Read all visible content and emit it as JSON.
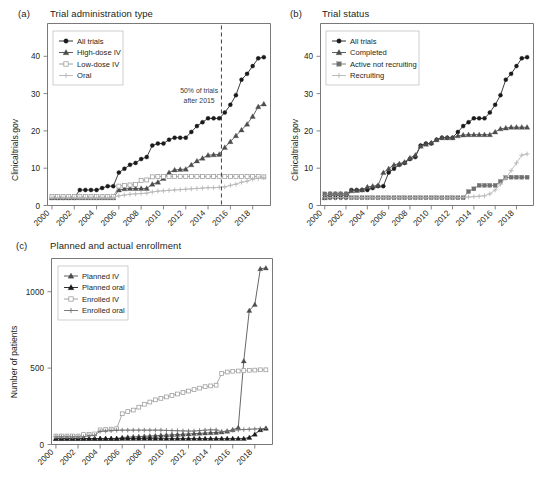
{
  "figure": {
    "background": "#ffffff",
    "width": 551,
    "height": 487
  },
  "panels": {
    "a": {
      "letter": "(a)",
      "title": "Trial administration type"
    },
    "b": {
      "letter": "(b)",
      "title": "Trial status"
    },
    "c": {
      "letter": "(c)",
      "title": "Planned and actual enrollment"
    }
  },
  "colors": {
    "all_trials": "#1a1a1a",
    "secondary": "#4d4d4d",
    "tertiary": "#9a9a9a",
    "quaternary": "#b5b5b5",
    "axis": "#6a6a6a",
    "text": "#231f20",
    "annotation": "#3a3a3a"
  },
  "chart_data": [
    {
      "id": "panel-a",
      "type": "line",
      "title": "Trial administration type",
      "panel_letter": "(a)",
      "xlabel": "",
      "ylabel": "Clinicaltrials.gov",
      "xlim": [
        1999.6,
        2019.6
      ],
      "ylim": [
        -2,
        45
      ],
      "yticks": [
        0,
        10,
        20,
        30,
        40
      ],
      "ytick_labels": [
        "0",
        "10",
        "20",
        "30",
        "40"
      ],
      "xticks": [
        2000,
        2002,
        2004,
        2006,
        2008,
        2010,
        2012,
        2014,
        2016,
        2018
      ],
      "xtick_labels": [
        "2000",
        "2002",
        "2004",
        "2006",
        "2008",
        "2010",
        "2012",
        "2014",
        "2016",
        "2018"
      ],
      "grid": false,
      "legend_position": "upper-left",
      "annotations": [
        {
          "text_line1": "50% of trials",
          "text_line2": "after 2015",
          "x": 2013.2,
          "y": 27
        }
      ],
      "vline": {
        "x": 2015.2,
        "style": "dashed",
        "label": "50% of trials after 2015"
      },
      "x": [
        2000,
        2000.5,
        2001,
        2001.5,
        2002,
        2002.5,
        2003,
        2003.5,
        2004,
        2004.5,
        2005,
        2005.5,
        2006,
        2006.5,
        2007,
        2007.5,
        2008,
        2008.5,
        2009,
        2009.5,
        2010,
        2010.5,
        2011,
        2011.5,
        2012,
        2012.5,
        2013,
        2013.5,
        2014,
        2014.5,
        2015,
        2015.5,
        2016,
        2016.5,
        2017,
        2017.5,
        2018,
        2018.5,
        2019
      ],
      "series": [
        {
          "name": "All trials",
          "marker": "circle-filled",
          "color": "#1a1a1a",
          "values": [
            0,
            0,
            0,
            0,
            0,
            2,
            2,
            2,
            2,
            2.5,
            3,
            3,
            6.5,
            7.5,
            8.5,
            9,
            10,
            10.5,
            13.5,
            14,
            14,
            15,
            15.5,
            15.5,
            15.5,
            17,
            18.5,
            19.5,
            20.5,
            20.5,
            20.5,
            22,
            24,
            26.5,
            30.5,
            32,
            34,
            36,
            36.3
          ]
        },
        {
          "name": "High-dose IV",
          "marker": "triangle-filled",
          "color": "#4d4d4d",
          "values": [
            0,
            0,
            0,
            0,
            0,
            0,
            0,
            0,
            0,
            0,
            0,
            0,
            2,
            2.3,
            2.4,
            2.4,
            2.4,
            2.4,
            3.5,
            4,
            5,
            6.5,
            7.2,
            7.3,
            7.4,
            8.5,
            9.5,
            10.2,
            11,
            11.1,
            11.2,
            13,
            14.5,
            16,
            17.5,
            19,
            21,
            23.5,
            24.2
          ]
        },
        {
          "name": "Low-dose IV",
          "marker": "square-open",
          "color": "#9a9a9a",
          "values": [
            0.3,
            0.3,
            0.3,
            0.3,
            0.3,
            0.3,
            0.3,
            0.3,
            0.3,
            0.3,
            0.3,
            0.3,
            3,
            3.2,
            3.3,
            3.4,
            4.5,
            4.6,
            5.4,
            5.5,
            5.5,
            5.5,
            5.5,
            5.5,
            5.5,
            5.5,
            5.5,
            5.5,
            5.5,
            5.5,
            5.5,
            5.5,
            5.5,
            5.5,
            5.5,
            5.5,
            5.5,
            5.5,
            5.4
          ]
        },
        {
          "name": "Oral",
          "marker": "plus",
          "color": "#b5b5b5",
          "values": [
            0,
            0,
            0,
            0,
            0,
            0,
            0,
            0,
            0,
            0,
            0,
            0,
            0.5,
            0.7,
            0.9,
            1,
            1.1,
            1.2,
            1.5,
            1.7,
            1.8,
            1.9,
            2,
            2.1,
            2.2,
            2.3,
            2.4,
            2.5,
            2.6,
            2.6,
            2.7,
            2.8,
            3.2,
            3.5,
            4,
            4.3,
            4.8,
            5,
            5.2
          ]
        }
      ]
    },
    {
      "id": "panel-b",
      "type": "line",
      "title": "Trial status",
      "panel_letter": "(b)",
      "xlabel": "",
      "ylabel": "Clinicaltrials.gov",
      "xlim": [
        1999.6,
        2019.6
      ],
      "ylim": [
        -2,
        45
      ],
      "yticks": [
        0,
        10,
        20,
        30,
        40
      ],
      "ytick_labels": [
        "0",
        "10",
        "20",
        "30",
        "40"
      ],
      "xticks": [
        2000,
        2002,
        2004,
        2006,
        2008,
        2010,
        2012,
        2014,
        2016,
        2018
      ],
      "xtick_labels": [
        "2000",
        "2002",
        "2004",
        "2006",
        "2008",
        "2010",
        "2012",
        "2014",
        "2016",
        "2018"
      ],
      "grid": false,
      "legend_position": "upper-left",
      "x": [
        2000,
        2000.5,
        2001,
        2001.5,
        2002,
        2002.5,
        2003,
        2003.5,
        2004,
        2004.5,
        2005,
        2005.5,
        2006,
        2006.5,
        2007,
        2007.5,
        2008,
        2008.5,
        2009,
        2009.5,
        2010,
        2010.5,
        2011,
        2011.5,
        2012,
        2012.5,
        2013,
        2013.5,
        2014,
        2014.5,
        2015,
        2015.5,
        2016,
        2016.5,
        2017,
        2017.5,
        2018,
        2018.5,
        2019
      ],
      "series": [
        {
          "name": "All trials",
          "marker": "circle-filled",
          "color": "#1a1a1a",
          "values": [
            0,
            0,
            0,
            0,
            0,
            2,
            2,
            2,
            2,
            2.5,
            3,
            3,
            6.5,
            7.5,
            8.5,
            9,
            10,
            10.5,
            13.5,
            14,
            14,
            15,
            15.5,
            15.5,
            15.5,
            17,
            18.5,
            19.5,
            20.5,
            20.5,
            20.5,
            22,
            24,
            26.5,
            30.5,
            32,
            34,
            36,
            36.3
          ]
        },
        {
          "name": "Completed",
          "marker": "triangle-filled",
          "color": "#4d4d4d",
          "values": [
            0,
            1,
            1,
            1,
            1,
            1.8,
            1.9,
            2,
            2.8,
            3,
            3.2,
            6.5,
            7.5,
            8.5,
            8.8,
            9.2,
            10.3,
            11,
            13.3,
            13.8,
            14.2,
            15,
            15.5,
            15.5,
            15.5,
            16,
            16.2,
            16.3,
            16.3,
            16.3,
            16.3,
            16.3,
            17,
            17.8,
            18,
            18.2,
            18.2,
            18.2,
            18.2
          ]
        },
        {
          "name": "Active not recruiting",
          "marker": "square-filled",
          "color": "#707070",
          "values": [
            1,
            1,
            1,
            1,
            1,
            0,
            0,
            0,
            0,
            0,
            0,
            0,
            0,
            0,
            0,
            0,
            0,
            0,
            0,
            0,
            0,
            0,
            0,
            0,
            0,
            0,
            0,
            1.6,
            2.3,
            3.2,
            3.2,
            3.2,
            3.2,
            4.2,
            5.2,
            5.3,
            5.3,
            5.3,
            5.3
          ]
        },
        {
          "name": "Recruiting",
          "marker": "plus",
          "color": "#b5b5b5",
          "values": [
            0,
            0,
            0,
            0,
            0,
            0,
            0,
            0,
            0,
            0,
            0,
            0,
            0,
            0,
            0,
            0,
            0,
            0,
            0,
            0,
            0,
            0,
            0,
            0,
            0,
            0,
            0.1,
            0.2,
            0.3,
            0.4,
            0.5,
            1,
            2,
            3.5,
            5,
            7,
            9,
            11,
            11.3
          ]
        }
      ]
    },
    {
      "id": "panel-c",
      "type": "line",
      "title": "Planned and actual enrollment",
      "panel_letter": "(c)",
      "xlabel": "",
      "ylabel": "Number of patients",
      "xlim": [
        1999.6,
        2019.6
      ],
      "ylim": [
        -40,
        1230
      ],
      "yticks": [
        0,
        500,
        1000
      ],
      "ytick_labels": [
        "0",
        "500",
        "1000"
      ],
      "xticks": [
        2000,
        2002,
        2004,
        2006,
        2008,
        2010,
        2012,
        2014,
        2016,
        2018
      ],
      "xtick_labels": [
        "2000",
        "2002",
        "2004",
        "2006",
        "2008",
        "2010",
        "2012",
        "2014",
        "2016",
        "2018"
      ],
      "grid": false,
      "legend_position": "upper-left",
      "x": [
        2000,
        2000.5,
        2001,
        2001.5,
        2002,
        2002.5,
        2003,
        2003.5,
        2004,
        2004.5,
        2005,
        2005.5,
        2006,
        2006.5,
        2007,
        2007.5,
        2008,
        2008.5,
        2009,
        2009.5,
        2010,
        2010.5,
        2011,
        2011.5,
        2012,
        2012.5,
        2013,
        2013.5,
        2014,
        2014.5,
        2015,
        2015.5,
        2016,
        2016.5,
        2017,
        2017.5,
        2018,
        2018.5,
        2019
      ],
      "series": [
        {
          "name": "Planned IV",
          "marker": "triangle-filled",
          "color": "#4d4d4d",
          "values": [
            0,
            0,
            0,
            0,
            0,
            0,
            0,
            0,
            0,
            0,
            0,
            0,
            8,
            10,
            12,
            14,
            16,
            18,
            20,
            22,
            24,
            26,
            28,
            30,
            32,
            34,
            36,
            38,
            40,
            42,
            44,
            50,
            60,
            75,
            530,
            875,
            915,
            1160,
            1165
          ]
        },
        {
          "name": "Planned oral",
          "marker": "triangle-filled",
          "color": "#1a1a1a",
          "values": [
            0,
            0,
            0,
            0,
            0,
            0,
            0,
            0,
            0,
            0,
            0,
            0,
            0,
            0,
            0,
            0,
            0,
            0,
            0,
            0,
            0,
            0,
            0,
            0,
            0,
            0,
            0,
            0,
            0,
            0,
            0,
            0,
            0,
            0,
            0,
            8,
            30,
            60,
            70
          ]
        },
        {
          "name": "Enrolled IV",
          "marker": "square-open",
          "color": "#9a9a9a",
          "values": [
            18,
            18,
            18,
            18,
            18,
            28,
            30,
            32,
            60,
            62,
            65,
            68,
            170,
            185,
            195,
            215,
            235,
            250,
            265,
            275,
            285,
            295,
            305,
            315,
            325,
            335,
            345,
            355,
            360,
            365,
            445,
            455,
            460,
            462,
            465,
            467,
            468,
            470,
            470
          ]
        },
        {
          "name": "Enrolled oral",
          "marker": "plus",
          "color": "#707070",
          "values": [
            12,
            12,
            12,
            12,
            12,
            12,
            20,
            22,
            50,
            52,
            55,
            57,
            58,
            58,
            58,
            58,
            58,
            58,
            58,
            58,
            56,
            55,
            54,
            53,
            52,
            52,
            55,
            58,
            60,
            60,
            48,
            52,
            58,
            60,
            62,
            64,
            66,
            68,
            70
          ]
        }
      ]
    }
  ]
}
